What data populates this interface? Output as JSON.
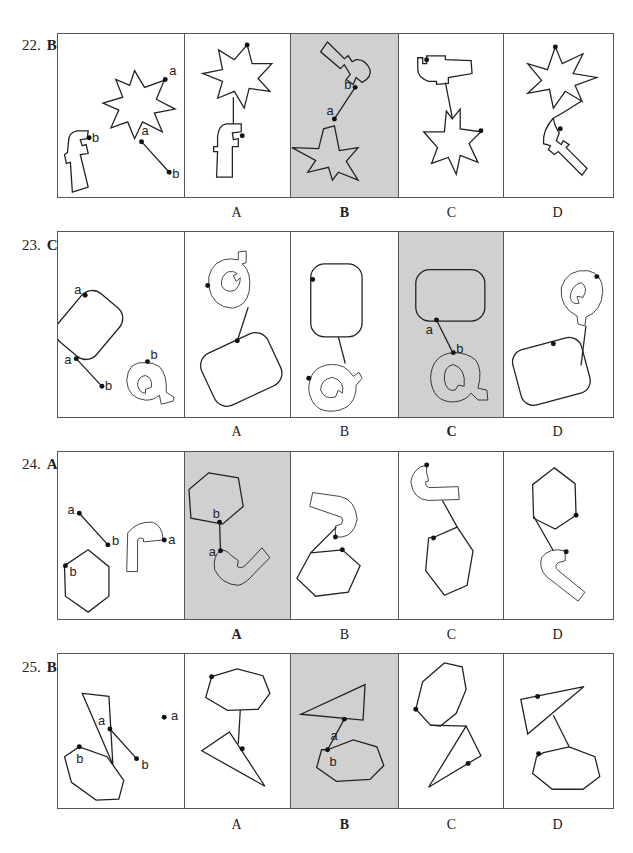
{
  "questions": [
    {
      "number": "22.",
      "answer": "B",
      "options": [
        "A",
        "B",
        "C",
        "D"
      ],
      "selected": "B",
      "shapes": "seven-pointed star and letter f",
      "points": [
        "a",
        "b"
      ]
    },
    {
      "number": "23.",
      "answer": "C",
      "options": [
        "A",
        "B",
        "C",
        "D"
      ],
      "selected": "C",
      "shapes": "rounded rectangle and letter Q",
      "points": [
        "a",
        "b"
      ]
    },
    {
      "number": "24.",
      "answer": "A",
      "options": [
        "A",
        "B",
        "C",
        "D"
      ],
      "selected": "A",
      "shapes": "hexagon and hook (J) shape",
      "points": [
        "a",
        "b"
      ]
    },
    {
      "number": "25.",
      "answer": "B",
      "options": [
        "A",
        "B",
        "C",
        "D"
      ],
      "selected": "B",
      "shapes": "heptagon and triangle",
      "points": [
        "a",
        "b"
      ]
    }
  ],
  "colors": {
    "selected_bg": "#d0d0d0",
    "border": "#555555",
    "stroke": "#222222"
  }
}
